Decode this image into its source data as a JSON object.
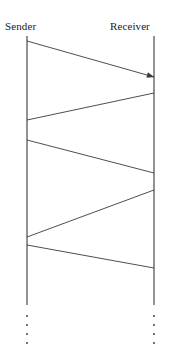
{
  "diagram": {
    "type": "sequence-diagram",
    "title": "",
    "background_color": "#ffffff",
    "line_color": "#3a3a3a",
    "text_color": "#1a1a1a",
    "lifelines": [
      {
        "id": "sender",
        "label": "Sender",
        "x": 27,
        "label_x": 5,
        "label_y": 20,
        "top_y": 36,
        "bottom_y": 305
      },
      {
        "id": "receiver",
        "label": "Receiver",
        "x": 154,
        "label_x": 110,
        "label_y": 20,
        "top_y": 36,
        "bottom_y": 305
      }
    ],
    "messages": [
      {
        "index": 1,
        "from": "sender",
        "to": "receiver",
        "x1": 27,
        "y1": 41,
        "x2": 154,
        "y2": 77,
        "arrowhead": true
      },
      {
        "index": 2,
        "from": "receiver",
        "to": "sender",
        "x1": 154,
        "y1": 93,
        "x2": 27,
        "y2": 120,
        "arrowhead": false
      },
      {
        "index": 3,
        "from": "sender",
        "to": "receiver",
        "x1": 27,
        "y1": 140,
        "x2": 154,
        "y2": 173,
        "arrowhead": false
      },
      {
        "index": 4,
        "from": "receiver",
        "to": "sender",
        "x1": 154,
        "y1": 190,
        "x2": 27,
        "y2": 237,
        "arrowhead": false
      },
      {
        "index": 5,
        "from": "sender",
        "to": "receiver",
        "x1": 27,
        "y1": 245,
        "x2": 154,
        "y2": 268,
        "arrowhead": false
      }
    ],
    "continuation_dots": [
      {
        "lifeline": "sender",
        "x": 27,
        "ys": [
          316,
          325,
          334,
          343
        ]
      },
      {
        "lifeline": "receiver",
        "x": 154,
        "ys": [
          316,
          325,
          334,
          343
        ]
      }
    ]
  }
}
